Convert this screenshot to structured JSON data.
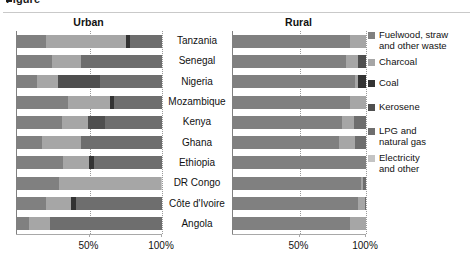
{
  "figure": {
    "cut_title": "Figure",
    "panels": [
      {
        "key": "urban",
        "label": "Urban"
      },
      {
        "key": "rural",
        "label": "Rural"
      }
    ],
    "axis": {
      "ticks": [
        "50%",
        "100%"
      ],
      "tick_values": [
        50,
        100
      ],
      "min": 0,
      "max": 100
    }
  },
  "legend": {
    "position": "right",
    "items": [
      {
        "label": "Fuelwood, straw\nand other waste",
        "color": "#808080"
      },
      {
        "label": "Charcoal",
        "color": "#a6a6a6"
      },
      {
        "label": "Coal",
        "color": "#333333"
      },
      {
        "label": "Kerosene",
        "color": "#4f4f4f"
      },
      {
        "label": "LPG and\nnatural gas",
        "color": "#6e6e6e"
      },
      {
        "label": "Electricity\nand other",
        "color": "#c4c4c4"
      }
    ]
  },
  "chart_data": {
    "type": "bar",
    "orientation": "horizontal",
    "stacked": true,
    "normalized": true,
    "title": "",
    "xlabel": "",
    "ylabel": "",
    "xlim": [
      0,
      100
    ],
    "grid": true,
    "xticks": [
      50,
      100
    ],
    "xticklabels": [
      "50%",
      "100%"
    ],
    "legend_position": "right",
    "categories": [
      "Tanzania",
      "Senegal",
      "Nigeria",
      "Mozambique",
      "Kenya",
      "Ghana",
      "Ethiopia",
      "DR Congo",
      "Côte d'Ivoire",
      "Angola"
    ],
    "series_names": [
      "Fuelwood, straw and other waste",
      "Charcoal",
      "Coal",
      "Kerosene",
      "LPG and natural gas",
      "Electricity and other"
    ],
    "series_colors": [
      "#808080",
      "#a6a6a6",
      "#333333",
      "#4f4f4f",
      "#6e6e6e",
      "#c4c4c4"
    ],
    "panels": [
      {
        "name": "Urban",
        "series": [
          {
            "name": "Fuelwood, straw and other waste",
            "values": [
              20,
              24,
              14,
              35,
              31,
              17,
              32,
              29,
              20,
              8
            ]
          },
          {
            "name": "Charcoal",
            "values": [
              55,
              20,
              14,
              29,
              18,
              27,
              18,
              70,
              17,
              15
            ]
          },
          {
            "name": "Coal",
            "values": [
              3,
              0,
              0,
              3,
              0,
              0,
              3,
              0,
              4,
              0
            ]
          },
          {
            "name": "Kerosene",
            "values": [
              0,
              0,
              29,
              0,
              12,
              0,
              0,
              0,
              0,
              0
            ]
          },
          {
            "name": "LPG and natural gas",
            "values": [
              22,
              56,
              43,
              33,
              39,
              56,
              47,
              0,
              59,
              77
            ]
          },
          {
            "name": "Electricity and other",
            "values": [
              0,
              0,
              0,
              0,
              0,
              0,
              0,
              1,
              0,
              0
            ]
          }
        ]
      },
      {
        "name": "Rural",
        "series": [
          {
            "name": "Fuelwood, straw and other waste",
            "values": [
              88,
              85,
              92,
              88,
              82,
              80,
              100,
              96,
              94,
              88
            ]
          },
          {
            "name": "Charcoal",
            "values": [
              12,
              9,
              2,
              12,
              9,
              12,
              0,
              2,
              5,
              12
            ]
          },
          {
            "name": "Coal",
            "values": [
              0,
              0,
              6,
              0,
              0,
              0,
              0,
              0,
              0,
              0
            ]
          },
          {
            "name": "Kerosene",
            "values": [
              0,
              6,
              0,
              0,
              0,
              0,
              0,
              0,
              0,
              0
            ]
          },
          {
            "name": "LPG and natural gas",
            "values": [
              0,
              0,
              0,
              0,
              9,
              8,
              0,
              2,
              1,
              0
            ]
          },
          {
            "name": "Electricity and other",
            "values": [
              0,
              0,
              0,
              0,
              0,
              0,
              0,
              0,
              0,
              0
            ]
          }
        ]
      }
    ]
  }
}
